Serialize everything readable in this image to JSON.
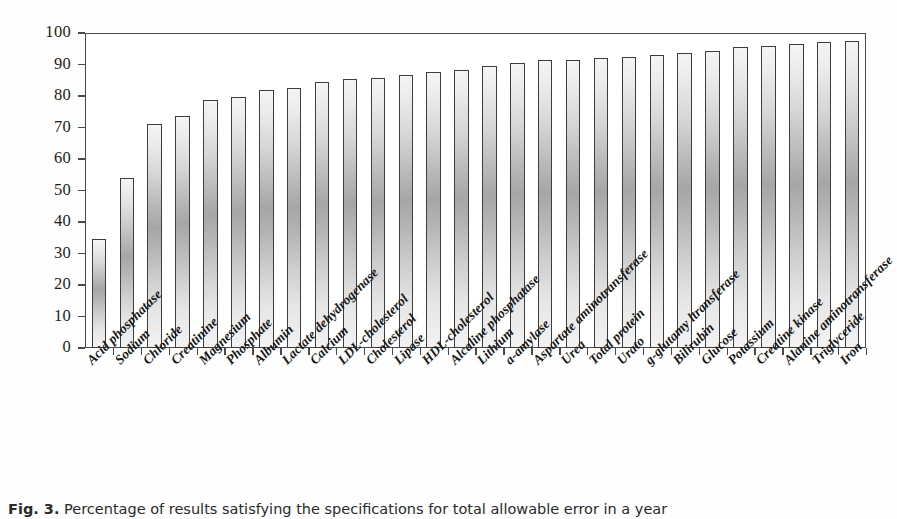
{
  "figure": {
    "caption_label": "Fig. 3.",
    "caption_text": "Percentage of results satisfying the specifications for total allowable error in a year"
  },
  "axis": {
    "y_ticks": [
      "0",
      "10",
      "20",
      "30",
      "40",
      "50",
      "60",
      "70",
      "80",
      "90",
      "100"
    ]
  },
  "chart_data": {
    "type": "bar",
    "title": "Percentage of results satisfying the specifications for total allowable error in a year",
    "xlabel": "",
    "ylabel": "",
    "ylim": [
      0,
      100
    ],
    "ytick_step": 10,
    "grid": false,
    "legend": "none",
    "bar_color": "#cfcfcf",
    "bar_edge_color": "#3d3d3d",
    "categories": [
      "Acid phosphatase",
      "Sodium",
      "Chloride",
      "Creatinine",
      "Magnesium",
      "Phosphate",
      "Albumin",
      "Lactate dehydrogenase",
      "Calcium",
      "LDL-cholesterol",
      "Cholesterol",
      "Lipase",
      "HDL-cholesterol",
      "Alcaline phosphatase",
      "Lithium",
      "a-amylase",
      "Aspartate aminotransferase",
      "Urea",
      "Total protein",
      "Urato",
      "g-glutamy ltransferase",
      "Bilirubin",
      "Glucose",
      "Potassium",
      "Creatine kinase",
      "Alanine aminotransferase",
      "Triglyceride",
      "Iron"
    ],
    "values": [
      34.5,
      54.0,
      71.0,
      73.8,
      78.6,
      79.8,
      81.9,
      82.6,
      84.6,
      85.4,
      85.7,
      86.6,
      87.6,
      88.4,
      89.5,
      90.6,
      91.3,
      91.5,
      92.2,
      92.5,
      93.0,
      93.5,
      94.3,
      95.6,
      95.9,
      96.6,
      97.0,
      97.6
    ]
  }
}
